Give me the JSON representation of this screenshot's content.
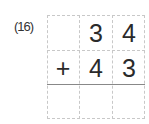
{
  "problem": {
    "label": "(16)",
    "rows": [
      [
        "",
        "3",
        "4"
      ],
      [
        "+",
        "4",
        "3"
      ],
      [
        "",
        "",
        ""
      ]
    ]
  }
}
